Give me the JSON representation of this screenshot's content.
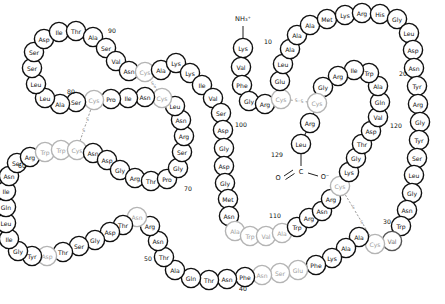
{
  "figure": {
    "type": "protein-sequence-diagram",
    "width": 445,
    "height": 304,
    "background": "#ffffff",
    "n_terminus_label": "NH₃⁺",
    "c_terminus_carbon": "C",
    "c_terminus_o_left": "O",
    "c_terminus_o_right": "O⁻",
    "disulfide_label": "S",
    "colors": {
      "outline_dark": "#101010",
      "outline_mid": "#555555",
      "outline_light": "#b4b4b4",
      "fill": "#ffffff",
      "text_dark": "#101010",
      "text_light": "#9e9e9e",
      "disulfide": "#9a9a9a"
    }
  },
  "numbers": [
    {
      "text": "10",
      "x": 268,
      "y": 41
    },
    {
      "text": "20",
      "x": 403,
      "y": 73
    },
    {
      "text": "30",
      "x": 387,
      "y": 221
    },
    {
      "text": "40",
      "x": 243,
      "y": 288
    },
    {
      "text": "50",
      "x": 148,
      "y": 258
    },
    {
      "text": "60",
      "x": 22,
      "y": 165
    },
    {
      "text": "70",
      "x": 188,
      "y": 188
    },
    {
      "text": "80",
      "x": 71,
      "y": 91
    },
    {
      "text": "90",
      "x": 112,
      "y": 30
    },
    {
      "text": "100",
      "x": 241,
      "y": 124
    },
    {
      "text": "110",
      "x": 275,
      "y": 215
    },
    {
      "text": "120",
      "x": 396,
      "y": 125
    },
    {
      "text": "129",
      "x": 277,
      "y": 154
    }
  ],
  "disulfides": [
    {
      "from": 6,
      "to": 127,
      "label_upper": "S",
      "label_lower": "S"
    },
    {
      "from": 30,
      "to": 115,
      "label_upper": "S",
      "label_lower": "S"
    },
    {
      "from": 64,
      "to": 80,
      "label_upper": "S",
      "label_lower": "S"
    },
    {
      "from": 76,
      "to": 94,
      "label_upper": "S",
      "label_lower": "S"
    }
  ],
  "residues": [
    {
      "n": 1,
      "aa": "Lys",
      "x": 243,
      "y": 48,
      "r": 9.6,
      "tone": "dark"
    },
    {
      "n": 2,
      "aa": "Val",
      "x": 241,
      "y": 67,
      "r": 9.6,
      "tone": "dark"
    },
    {
      "n": 3,
      "aa": "Phe",
      "x": 242,
      "y": 85,
      "r": 9.6,
      "tone": "dark"
    },
    {
      "n": 4,
      "aa": "Gly",
      "x": 249,
      "y": 101,
      "r": 9.6,
      "tone": "dark"
    },
    {
      "n": 5,
      "aa": "Arg",
      "x": 265,
      "y": 104,
      "r": 9.6,
      "tone": "dark"
    },
    {
      "n": 6,
      "aa": "Cys",
      "x": 281,
      "y": 99,
      "r": 9.6,
      "tone": "light"
    },
    {
      "n": 7,
      "aa": "Glu",
      "x": 280,
      "y": 81,
      "r": 9.6,
      "tone": "dark"
    },
    {
      "n": 8,
      "aa": "Leu",
      "x": 283,
      "y": 64,
      "r": 9.6,
      "tone": "dark"
    },
    {
      "n": 9,
      "aa": "Ala",
      "x": 290,
      "y": 49,
      "r": 9.6,
      "tone": "dark"
    },
    {
      "n": 10,
      "aa": "Ala",
      "x": 297,
      "y": 35,
      "r": 9.6,
      "tone": "dark"
    },
    {
      "n": 11,
      "aa": "Ala",
      "x": 310,
      "y": 25,
      "r": 9.6,
      "tone": "dark"
    },
    {
      "n": 12,
      "aa": "Met",
      "x": 327,
      "y": 19,
      "r": 9.6,
      "tone": "dark"
    },
    {
      "n": 13,
      "aa": "Lys",
      "x": 345,
      "y": 15,
      "r": 9.6,
      "tone": "dark"
    },
    {
      "n": 14,
      "aa": "Arg",
      "x": 362,
      "y": 13,
      "r": 9.6,
      "tone": "dark"
    },
    {
      "n": 15,
      "aa": "His",
      "x": 380,
      "y": 14,
      "r": 9.6,
      "tone": "dark"
    },
    {
      "n": 16,
      "aa": "Gly",
      "x": 397,
      "y": 19,
      "r": 9.6,
      "tone": "dark"
    },
    {
      "n": 17,
      "aa": "Leu",
      "x": 409,
      "y": 33,
      "r": 9.6,
      "tone": "dark"
    },
    {
      "n": 18,
      "aa": "Asp",
      "x": 413,
      "y": 50,
      "r": 9.6,
      "tone": "dark"
    },
    {
      "n": 19,
      "aa": "Asn",
      "x": 414,
      "y": 68,
      "r": 9.6,
      "tone": "dark"
    },
    {
      "n": 20,
      "aa": "Tyr",
      "x": 417,
      "y": 86,
      "r": 9.6,
      "tone": "dark"
    },
    {
      "n": 21,
      "aa": "Arg",
      "x": 418,
      "y": 104,
      "r": 9.6,
      "tone": "dark"
    },
    {
      "n": 22,
      "aa": "Gly",
      "x": 420,
      "y": 122,
      "r": 9.6,
      "tone": "dark"
    },
    {
      "n": 23,
      "aa": "Tyr",
      "x": 419,
      "y": 140,
      "r": 9.6,
      "tone": "dark"
    },
    {
      "n": 24,
      "aa": "Ser",
      "x": 417,
      "y": 158,
      "r": 9.6,
      "tone": "dark"
    },
    {
      "n": 25,
      "aa": "Leu",
      "x": 414,
      "y": 175,
      "r": 9.6,
      "tone": "dark"
    },
    {
      "n": 26,
      "aa": "Gly",
      "x": 412,
      "y": 193,
      "r": 9.6,
      "tone": "dark"
    },
    {
      "n": 27,
      "aa": "Asn",
      "x": 407,
      "y": 210,
      "r": 9.6,
      "tone": "dark"
    },
    {
      "n": 28,
      "aa": "Trp",
      "x": 401,
      "y": 226,
      "r": 9.6,
      "tone": "dark"
    },
    {
      "n": 29,
      "aa": "Val",
      "x": 392,
      "y": 241,
      "r": 9.6,
      "tone": "mid"
    },
    {
      "n": 30,
      "aa": "Cys",
      "x": 375,
      "y": 244,
      "r": 9.6,
      "tone": "light"
    },
    {
      "n": 31,
      "aa": "Ala",
      "x": 359,
      "y": 237,
      "r": 9.6,
      "tone": "dark"
    },
    {
      "n": 32,
      "aa": "Ala",
      "x": 346,
      "y": 248,
      "r": 9.6,
      "tone": "dark"
    },
    {
      "n": 33,
      "aa": "Lys",
      "x": 332,
      "y": 258,
      "r": 9.6,
      "tone": "dark"
    },
    {
      "n": 34,
      "aa": "Phe",
      "x": 316,
      "y": 265,
      "r": 9.6,
      "tone": "dark"
    },
    {
      "n": 35,
      "aa": "Glu",
      "x": 298,
      "y": 270,
      "r": 9.6,
      "tone": "light"
    },
    {
      "n": 36,
      "aa": "Ser",
      "x": 280,
      "y": 273,
      "r": 9.6,
      "tone": "light"
    },
    {
      "n": 37,
      "aa": "Asn",
      "x": 262,
      "y": 275,
      "r": 9.6,
      "tone": "light"
    },
    {
      "n": 38,
      "aa": "Phe",
      "x": 245,
      "y": 277,
      "r": 9.6,
      "tone": "dark"
    },
    {
      "n": 39,
      "aa": "Asn",
      "x": 227,
      "y": 279,
      "r": 9.6,
      "tone": "dark"
    },
    {
      "n": 40,
      "aa": "Thr",
      "x": 209,
      "y": 280,
      "r": 9.6,
      "tone": "dark"
    },
    {
      "n": 41,
      "aa": "Gln",
      "x": 191,
      "y": 278,
      "r": 9.6,
      "tone": "dark"
    },
    {
      "n": 42,
      "aa": "Ala",
      "x": 175,
      "y": 270,
      "r": 9.6,
      "tone": "dark"
    },
    {
      "n": 43,
      "aa": "Thr",
      "x": 164,
      "y": 257,
      "r": 9.6,
      "tone": "dark"
    },
    {
      "n": 44,
      "aa": "Asn",
      "x": 158,
      "y": 241,
      "r": 9.6,
      "tone": "dark"
    },
    {
      "n": 45,
      "aa": "Arg",
      "x": 150,
      "y": 226,
      "r": 9.6,
      "tone": "dark"
    },
    {
      "n": 46,
      "aa": "Asn",
      "x": 137,
      "y": 217,
      "r": 9.6,
      "tone": "light"
    },
    {
      "n": 47,
      "aa": "Thr",
      "x": 123,
      "y": 225,
      "r": 9.6,
      "tone": "dark"
    },
    {
      "n": 48,
      "aa": "Asp",
      "x": 110,
      "y": 232,
      "r": 9.6,
      "tone": "dark"
    },
    {
      "n": 49,
      "aa": "Gly",
      "x": 95,
      "y": 240,
      "r": 9.6,
      "tone": "dark"
    },
    {
      "n": 50,
      "aa": "Ser",
      "x": 79,
      "y": 246,
      "r": 9.6,
      "tone": "dark"
    },
    {
      "n": 51,
      "aa": "Thr",
      "x": 63,
      "y": 252,
      "r": 9.6,
      "tone": "dark"
    },
    {
      "n": 52,
      "aa": "Asp",
      "x": 47,
      "y": 256,
      "r": 9.6,
      "tone": "light"
    },
    {
      "n": 53,
      "aa": "Tyr",
      "x": 32,
      "y": 256,
      "r": 9.6,
      "tone": "dark"
    },
    {
      "n": 54,
      "aa": "Gly",
      "x": 18,
      "y": 251,
      "r": 9.6,
      "tone": "dark"
    },
    {
      "n": 55,
      "aa": "Ile",
      "x": 9,
      "y": 239,
      "r": 9.6,
      "tone": "dark"
    },
    {
      "n": 56,
      "aa": "Leu",
      "x": 6,
      "y": 223,
      "r": 9.6,
      "tone": "dark"
    },
    {
      "n": 57,
      "aa": "Gln",
      "x": 6,
      "y": 207,
      "r": 9.6,
      "tone": "dark"
    },
    {
      "n": 58,
      "aa": "Ile",
      "x": 6,
      "y": 191,
      "r": 9.6,
      "tone": "dark"
    },
    {
      "n": 59,
      "aa": "Asn",
      "x": 9,
      "y": 176,
      "r": 9.6,
      "tone": "dark"
    },
    {
      "n": 60,
      "aa": "Ser",
      "x": 17,
      "y": 163,
      "r": 9.6,
      "tone": "dark"
    },
    {
      "n": 61,
      "aa": "Arg",
      "x": 30,
      "y": 157,
      "r": 9.6,
      "tone": "dark"
    },
    {
      "n": 62,
      "aa": "Trp",
      "x": 45,
      "y": 152,
      "r": 9.6,
      "tone": "light"
    },
    {
      "n": 63,
      "aa": "Trp",
      "x": 61,
      "y": 150,
      "r": 9.6,
      "tone": "light"
    },
    {
      "n": 64,
      "aa": "Cys",
      "x": 77,
      "y": 150,
      "r": 9.6,
      "tone": "light"
    },
    {
      "n": 65,
      "aa": "Asn",
      "x": 93,
      "y": 153,
      "r": 9.6,
      "tone": "dark"
    },
    {
      "n": 66,
      "aa": "Asp",
      "x": 107,
      "y": 160,
      "r": 9.6,
      "tone": "dark"
    },
    {
      "n": 67,
      "aa": "Gly",
      "x": 120,
      "y": 170,
      "r": 9.6,
      "tone": "dark"
    },
    {
      "n": 68,
      "aa": "Arg",
      "x": 135,
      "y": 178,
      "r": 9.6,
      "tone": "dark"
    },
    {
      "n": 69,
      "aa": "Thr",
      "x": 151,
      "y": 181,
      "r": 9.6,
      "tone": "dark"
    },
    {
      "n": 70,
      "aa": "Pro",
      "x": 167,
      "y": 179,
      "r": 9.6,
      "tone": "dark"
    },
    {
      "n": 71,
      "aa": "Gly",
      "x": 178,
      "y": 168,
      "r": 9.6,
      "tone": "dark"
    },
    {
      "n": 72,
      "aa": "Ser",
      "x": 182,
      "y": 152,
      "r": 9.6,
      "tone": "dark"
    },
    {
      "n": 73,
      "aa": "Arg",
      "x": 184,
      "y": 136,
      "r": 9.6,
      "tone": "dark"
    },
    {
      "n": 74,
      "aa": "Asn",
      "x": 181,
      "y": 120,
      "r": 9.6,
      "tone": "dark"
    },
    {
      "n": 75,
      "aa": "Leu",
      "x": 175,
      "y": 106,
      "r": 9.6,
      "tone": "dark"
    },
    {
      "n": 76,
      "aa": "Cys",
      "x": 162,
      "y": 98,
      "r": 9.6,
      "tone": "light"
    },
    {
      "n": 77,
      "aa": "Asn",
      "x": 145,
      "y": 97,
      "r": 9.6,
      "tone": "dark"
    },
    {
      "n": 78,
      "aa": "Ile",
      "x": 128,
      "y": 98,
      "r": 9.6,
      "tone": "dark"
    },
    {
      "n": 79,
      "aa": "Pro",
      "x": 111,
      "y": 99,
      "r": 9.6,
      "tone": "dark"
    },
    {
      "n": 80,
      "aa": "Cys",
      "x": 94,
      "y": 100,
      "r": 9.6,
      "tone": "light"
    },
    {
      "n": 81,
      "aa": "Ser",
      "x": 76,
      "y": 102,
      "r": 9.6,
      "tone": "dark"
    },
    {
      "n": 82,
      "aa": "Ala",
      "x": 60,
      "y": 104,
      "r": 9.6,
      "tone": "dark"
    },
    {
      "n": 83,
      "aa": "Leu",
      "x": 45,
      "y": 98,
      "r": 9.6,
      "tone": "dark"
    },
    {
      "n": 84,
      "aa": "Leu",
      "x": 36,
      "y": 84,
      "r": 9.6,
      "tone": "dark"
    },
    {
      "n": 85,
      "aa": "Ser",
      "x": 32,
      "y": 68,
      "r": 9.6,
      "tone": "dark"
    },
    {
      "n": 86,
      "aa": "Ser",
      "x": 34,
      "y": 52,
      "r": 9.6,
      "tone": "dark"
    },
    {
      "n": 87,
      "aa": "Asp",
      "x": 44,
      "y": 39,
      "r": 9.6,
      "tone": "dark"
    },
    {
      "n": 88,
      "aa": "Ile",
      "x": 59,
      "y": 32,
      "r": 9.6,
      "tone": "dark"
    },
    {
      "n": 89,
      "aa": "Thr",
      "x": 76,
      "y": 31,
      "r": 9.6,
      "tone": "dark"
    },
    {
      "n": 90,
      "aa": "Ala",
      "x": 93,
      "y": 37,
      "r": 9.6,
      "tone": "dark"
    },
    {
      "n": 91,
      "aa": "Ser",
      "x": 106,
      "y": 48,
      "r": 9.6,
      "tone": "dark"
    },
    {
      "n": 92,
      "aa": "Val",
      "x": 116,
      "y": 61,
      "r": 9.6,
      "tone": "dark"
    },
    {
      "n": 93,
      "aa": "Asn",
      "x": 129,
      "y": 71,
      "r": 9.6,
      "tone": "dark"
    },
    {
      "n": 94,
      "aa": "Cys",
      "x": 145,
      "y": 72,
      "r": 9.6,
      "tone": "light"
    },
    {
      "n": 95,
      "aa": "Ala",
      "x": 161,
      "y": 70,
      "r": 9.6,
      "tone": "dark"
    },
    {
      "n": 96,
      "aa": "Lys",
      "x": 176,
      "y": 63,
      "r": 9.6,
      "tone": "dark"
    },
    {
      "n": 97,
      "aa": "Lys",
      "x": 190,
      "y": 73,
      "r": 9.6,
      "tone": "dark"
    },
    {
      "n": 98,
      "aa": "Ile",
      "x": 202,
      "y": 85,
      "r": 9.6,
      "tone": "dark"
    },
    {
      "n": 99,
      "aa": "Val",
      "x": 213,
      "y": 98,
      "r": 9.6,
      "tone": "dark"
    },
    {
      "n": 100,
      "aa": "Ser",
      "x": 221,
      "y": 113,
      "r": 9.6,
      "tone": "dark"
    },
    {
      "n": 101,
      "aa": "Asp",
      "x": 223,
      "y": 130,
      "r": 9.6,
      "tone": "dark"
    },
    {
      "n": 102,
      "aa": "Gly",
      "x": 224,
      "y": 148,
      "r": 9.6,
      "tone": "dark"
    },
    {
      "n": 103,
      "aa": "Asp",
      "x": 224,
      "y": 166,
      "r": 9.6,
      "tone": "dark"
    },
    {
      "n": 104,
      "aa": "Gly",
      "x": 225,
      "y": 183,
      "r": 9.6,
      "tone": "dark"
    },
    {
      "n": 105,
      "aa": "Met",
      "x": 228,
      "y": 199,
      "r": 9.6,
      "tone": "dark"
    },
    {
      "n": 106,
      "aa": "Asn",
      "x": 229,
      "y": 216,
      "r": 9.6,
      "tone": "dark"
    },
    {
      "n": 107,
      "aa": "Ala",
      "x": 235,
      "y": 231,
      "r": 9.6,
      "tone": "light"
    },
    {
      "n": 108,
      "aa": "Trp",
      "x": 250,
      "y": 236,
      "r": 9.6,
      "tone": "light"
    },
    {
      "n": 109,
      "aa": "Val",
      "x": 266,
      "y": 236,
      "r": 9.6,
      "tone": "light"
    },
    {
      "n": 110,
      "aa": "Ala",
      "x": 282,
      "y": 233,
      "r": 9.6,
      "tone": "light"
    },
    {
      "n": 111,
      "aa": "Trp",
      "x": 297,
      "y": 227,
      "r": 9.6,
      "tone": "dark"
    },
    {
      "n": 112,
      "aa": "Arg",
      "x": 309,
      "y": 218,
      "r": 9.6,
      "tone": "dark"
    },
    {
      "n": 113,
      "aa": "Asn",
      "x": 322,
      "y": 211,
      "r": 9.6,
      "tone": "dark"
    },
    {
      "n": 114,
      "aa": "Arg",
      "x": 331,
      "y": 199,
      "r": 9.6,
      "tone": "dark"
    },
    {
      "n": 115,
      "aa": "Cys",
      "x": 340,
      "y": 186,
      "r": 9.6,
      "tone": "light"
    },
    {
      "n": 116,
      "aa": "Lys",
      "x": 349,
      "y": 172,
      "r": 9.6,
      "tone": "dark"
    },
    {
      "n": 117,
      "aa": "Gly",
      "x": 356,
      "y": 158,
      "r": 9.6,
      "tone": "dark"
    },
    {
      "n": 118,
      "aa": "Thr",
      "x": 362,
      "y": 144,
      "r": 9.6,
      "tone": "dark"
    },
    {
      "n": 119,
      "aa": "Asp",
      "x": 371,
      "y": 131,
      "r": 9.6,
      "tone": "dark"
    },
    {
      "n": 120,
      "aa": "Val",
      "x": 378,
      "y": 117,
      "r": 9.6,
      "tone": "dark"
    },
    {
      "n": 121,
      "aa": "Gln",
      "x": 380,
      "y": 102,
      "r": 9.6,
      "tone": "dark"
    },
    {
      "n": 122,
      "aa": "Ala",
      "x": 378,
      "y": 86,
      "r": 9.6,
      "tone": "dark"
    },
    {
      "n": 123,
      "aa": "Trp",
      "x": 369,
      "y": 73,
      "r": 9.6,
      "tone": "dark"
    },
    {
      "n": 124,
      "aa": "Ile",
      "x": 354,
      "y": 70,
      "r": 9.6,
      "tone": "dark"
    },
    {
      "n": 125,
      "aa": "Arg",
      "x": 338,
      "y": 76,
      "r": 9.6,
      "tone": "dark"
    },
    {
      "n": 126,
      "aa": "Gly",
      "x": 323,
      "y": 87,
      "r": 9.6,
      "tone": "dark"
    },
    {
      "n": 127,
      "aa": "Cys",
      "x": 317,
      "y": 103,
      "r": 9.6,
      "tone": "light"
    },
    {
      "n": 128,
      "aa": "Arg",
      "x": 310,
      "y": 123,
      "r": 9.6,
      "tone": "dark"
    },
    {
      "n": 129,
      "aa": "Leu",
      "x": 301,
      "y": 144,
      "r": 9.6,
      "tone": "dark"
    }
  ]
}
